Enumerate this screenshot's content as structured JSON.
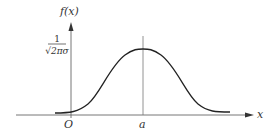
{
  "diagram": {
    "y_axis_label": "f(x)",
    "x_axis_label": "x",
    "origin_label": "O",
    "mean_label": "a",
    "peak_value_label": {
      "numerator": "1",
      "denominator": "√2πσ"
    },
    "colors": {
      "line": "#333333",
      "axis": "#555555",
      "background": "#ffffff"
    }
  }
}
